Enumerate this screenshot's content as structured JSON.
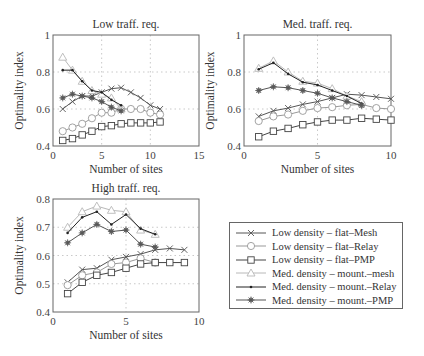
{
  "chart_data": [
    {
      "type": "line",
      "title": "Low traff. req.",
      "xlabel": "Number of sites",
      "ylabel": "Optimality index",
      "xlim": [
        0,
        15
      ],
      "ylim": [
        0.4,
        1.0
      ],
      "xticks": [
        0,
        5,
        10,
        15
      ],
      "yticks": [
        0.4,
        0.6,
        0.8,
        1.0
      ],
      "ytick_labels": [
        "0.4",
        "0.6",
        "0.8",
        "1"
      ],
      "grid": true,
      "plot_box": {
        "left": 53,
        "right": 199,
        "top": 35,
        "bottom": 146
      },
      "series": [
        {
          "name": "Low density – flat–Mesh",
          "x": [
            1,
            2,
            3,
            4,
            5,
            6,
            7,
            8,
            9,
            10,
            11
          ],
          "values": [
            0.6,
            0.64,
            0.67,
            0.67,
            0.69,
            0.71,
            0.715,
            0.69,
            0.66,
            0.62,
            0.6
          ]
        },
        {
          "name": "Low density – flat–Relay",
          "x": [
            1,
            2,
            3,
            4,
            5,
            6,
            7,
            8,
            9,
            10,
            11
          ],
          "values": [
            0.48,
            0.5,
            0.52,
            0.55,
            0.58,
            0.58,
            0.6,
            0.6,
            0.6,
            0.58,
            0.57
          ]
        },
        {
          "name": "Low density – flat–PMP",
          "x": [
            1,
            2,
            3,
            4,
            5,
            6,
            7,
            8,
            9,
            10,
            11
          ],
          "values": [
            0.43,
            0.44,
            0.46,
            0.48,
            0.505,
            0.51,
            0.52,
            0.525,
            0.525,
            0.525,
            0.53
          ]
        },
        {
          "name": "Med. density – mount.–mesh",
          "x": [
            1,
            2,
            3,
            4,
            5,
            6,
            7
          ],
          "values": [
            0.88,
            0.81,
            0.75,
            0.7,
            0.68,
            0.66,
            0.6
          ]
        },
        {
          "name": "Med. density – mount.–Relay",
          "x": [
            1,
            2,
            3,
            4,
            5,
            6,
            7
          ],
          "values": [
            0.81,
            0.81,
            0.75,
            0.7,
            0.69,
            0.65,
            0.62
          ]
        },
        {
          "name": "Med. density – mount.–PMP",
          "x": [
            1,
            2,
            3,
            4,
            5,
            6,
            7
          ],
          "values": [
            0.66,
            0.68,
            0.67,
            0.66,
            0.64,
            0.61,
            0.59
          ]
        }
      ]
    },
    {
      "type": "line",
      "title": "Med. traff. req.",
      "xlabel": "Number of sites",
      "ylabel": "Optimality index",
      "xlim": [
        0,
        10
      ],
      "ylim": [
        0.4,
        1.0
      ],
      "xticks": [
        0,
        5,
        10
      ],
      "yticks": [
        0.4,
        0.6,
        0.8,
        1.0
      ],
      "ytick_labels": [
        "0.4",
        "0.6",
        "0.8",
        "1"
      ],
      "grid": true,
      "plot_box": {
        "left": 244,
        "right": 391,
        "top": 35,
        "bottom": 146
      },
      "series": [
        {
          "name": "Low density – flat–Mesh",
          "x": [
            1,
            2,
            3,
            4,
            5,
            6,
            7,
            8,
            9,
            10
          ],
          "values": [
            0.56,
            0.59,
            0.605,
            0.625,
            0.64,
            0.66,
            0.68,
            0.675,
            0.665,
            0.655
          ]
        },
        {
          "name": "Low density – flat–Relay",
          "x": [
            1,
            2,
            3,
            4,
            5,
            6,
            7,
            8,
            9,
            10
          ],
          "values": [
            0.535,
            0.56,
            0.57,
            0.59,
            0.605,
            0.61,
            0.62,
            0.625,
            0.605,
            0.6
          ]
        },
        {
          "name": "Low density – flat–PMP",
          "x": [
            1,
            2,
            3,
            4,
            5,
            6,
            7,
            8,
            9,
            10
          ],
          "values": [
            0.45,
            0.48,
            0.495,
            0.515,
            0.53,
            0.54,
            0.54,
            0.55,
            0.545,
            0.54
          ]
        },
        {
          "name": "Med. density – mount.–mesh",
          "x": [
            1,
            2,
            3,
            4,
            5,
            6,
            7,
            8
          ],
          "values": [
            0.82,
            0.86,
            0.8,
            0.75,
            0.74,
            0.71,
            0.67,
            0.64
          ]
        },
        {
          "name": "Med. density – mount.–Relay",
          "x": [
            1,
            2,
            3,
            4,
            5,
            6,
            7,
            8
          ],
          "values": [
            0.815,
            0.85,
            0.79,
            0.745,
            0.73,
            0.7,
            0.67,
            0.63
          ]
        },
        {
          "name": "Med. density – mount.–PMP",
          "x": [
            1,
            2,
            3,
            4,
            5,
            6,
            7,
            8
          ],
          "values": [
            0.7,
            0.72,
            0.715,
            0.7,
            0.685,
            0.66,
            0.64,
            0.62
          ]
        }
      ]
    },
    {
      "type": "line",
      "title": "High traff. req.",
      "xlabel": "Number of sites",
      "ylabel": "Optimality index",
      "xlim": [
        0,
        10
      ],
      "ylim": [
        0.4,
        0.8
      ],
      "xticks": [
        0,
        5,
        10
      ],
      "yticks": [
        0.4,
        0.5,
        0.6,
        0.7,
        0.8
      ],
      "ytick_labels": [
        "0.4",
        "0.5",
        "0.6",
        "0.7",
        "0.8"
      ],
      "grid": true,
      "plot_box": {
        "left": 53,
        "right": 199,
        "top": 199,
        "bottom": 312
      },
      "series": [
        {
          "name": "Low density – flat–Mesh",
          "x": [
            1,
            2,
            3,
            4,
            5,
            6,
            7,
            8,
            9
          ],
          "values": [
            0.505,
            0.55,
            0.555,
            0.585,
            0.595,
            0.605,
            0.62,
            0.625,
            0.62
          ]
        },
        {
          "name": "Low density – flat–Relay",
          "x": [
            1,
            2,
            3,
            4,
            5,
            6,
            7
          ],
          "values": [
            0.495,
            0.53,
            0.54,
            0.57,
            0.575,
            0.59,
            0.575
          ]
        },
        {
          "name": "Low density – flat–PMP",
          "x": [
            1,
            2,
            3,
            4,
            5,
            6,
            7,
            8,
            9
          ],
          "values": [
            0.465,
            0.505,
            0.53,
            0.54,
            0.555,
            0.57,
            0.575,
            0.575,
            0.575
          ]
        },
        {
          "name": "Med. density – mount.–mesh",
          "x": [
            1,
            2,
            3,
            4,
            5,
            6,
            7
          ],
          "values": [
            0.7,
            0.755,
            0.775,
            0.76,
            0.755,
            0.69,
            0.675
          ]
        },
        {
          "name": "Med. density – mount.–Relay",
          "x": [
            1,
            2,
            3,
            4,
            5,
            6,
            7
          ],
          "values": [
            0.68,
            0.735,
            0.755,
            0.71,
            0.745,
            0.695,
            0.675
          ]
        },
        {
          "name": "Med. density – mount.–PMP",
          "x": [
            1,
            2,
            3,
            4,
            5,
            6,
            7
          ],
          "values": [
            0.645,
            0.68,
            0.71,
            0.685,
            0.69,
            0.64,
            0.63
          ]
        }
      ]
    }
  ],
  "legend": {
    "position": "lower-right",
    "entries": [
      {
        "label": "Low density – flat–Mesh",
        "marker": "x-mark-icon",
        "color": "#555555"
      },
      {
        "label": "Low density – flat–Relay",
        "marker": "circle-icon",
        "color": "#999999"
      },
      {
        "label": "Low density – flat–PMP",
        "marker": "square-icon",
        "color": "#444444"
      },
      {
        "label": "Med. density – mount.–mesh",
        "marker": "triangle-icon",
        "color": "#b8b8b8"
      },
      {
        "label": "Med. density – mount.–Relay",
        "marker": "dot-icon",
        "color": "#222222"
      },
      {
        "label": "Med. density – mount.–PMP",
        "marker": "asterisk-icon",
        "color": "#555555"
      }
    ]
  }
}
